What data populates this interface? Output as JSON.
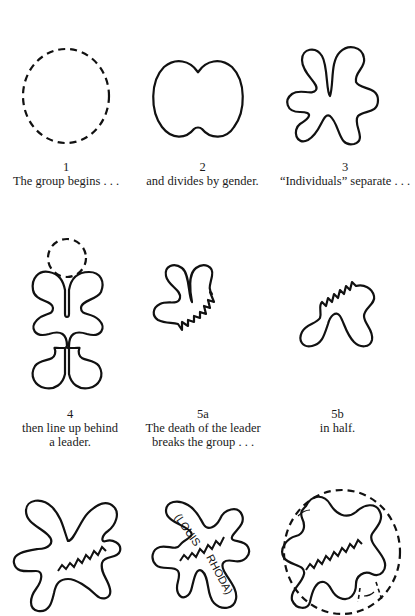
{
  "figures": [
    {
      "id": "1",
      "number": "1",
      "caption": [
        "The group begins . . ."
      ],
      "shape": "dashed-circle"
    },
    {
      "id": "2",
      "number": "2",
      "caption": [
        "and divides by gender."
      ],
      "shape": "two-lobed-blob"
    },
    {
      "id": "3",
      "number": "3",
      "caption": [
        "“Individuals” separate . . ."
      ],
      "shape": "six-armed-blob"
    },
    {
      "id": "4",
      "number": "4",
      "caption": [
        "then line up behind",
        "a leader."
      ],
      "shape": "dashed-circle-above-four-lobed-blob"
    },
    {
      "id": "5a",
      "number": "5a",
      "caption": [
        "The death of the leader",
        "breaks the group . . ."
      ],
      "shape": "upper-half-with-jagged-edge"
    },
    {
      "id": "5b",
      "number": "5b",
      "caption": [
        "in half."
      ],
      "shape": "lower-half-with-jagged-edge"
    },
    {
      "id": "6",
      "number": "",
      "caption": [],
      "shape": "rejoined-blob-with-zigzag-seam"
    },
    {
      "id": "7",
      "number": "",
      "caption": [],
      "shape": "rejoined-blob-with-names",
      "labels": [
        "(LOUIS",
        "RHODA)"
      ]
    },
    {
      "id": "8",
      "number": "",
      "caption": [],
      "shape": "rejoined-blob-inside-dashed-circle"
    }
  ]
}
